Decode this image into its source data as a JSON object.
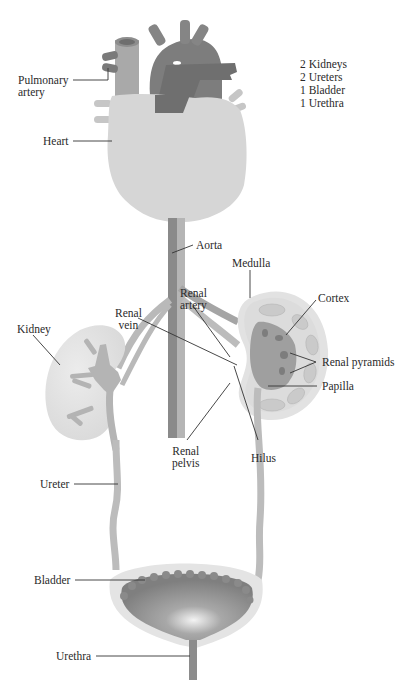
{
  "diagram": {
    "summary": [
      "2 Kidneys",
      "2 Ureters",
      "1 Bladder",
      "1 Urethra"
    ],
    "labels": {
      "pulmonary_artery": "Pulmonary\nartery",
      "heart": "Heart",
      "aorta": "Aorta",
      "medulla": "Medulla",
      "cortex": "Cortex",
      "renal_artery": "Renal\nartery",
      "renal_vein": "Renal\nvein",
      "kidney": "Kidney",
      "renal_pyramids": "Renal pyramids",
      "papilla": "Papilla",
      "renal_pelvis": "Renal\npelvis",
      "hilus": "Hilus",
      "ureter": "Ureter",
      "bladder": "Bladder",
      "urethra": "Urethra"
    },
    "colors": {
      "heart": "#d6d6d6",
      "vessel_light": "#bdbdbd",
      "vessel_mid": "#8f8f8f",
      "vessel_dark": "#6f6f6f",
      "kidney_outer": "#dedede",
      "kidney_inner": "#a6a6a6",
      "bladder_wall": "#e4e4e4",
      "bladder_inner": "#8a8a8a",
      "leader": "#333333",
      "text": "#2a2a2a"
    }
  }
}
